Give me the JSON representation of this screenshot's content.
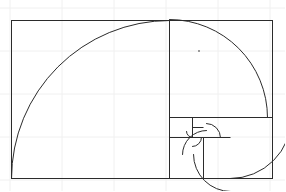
{
  "page": {
    "width": 285,
    "height": 191,
    "background_color": "#ffffff"
  },
  "style": {
    "stroke_color": "#2b2b2b",
    "grid_color": "#f0f0f0",
    "stroke_width": 1,
    "grid_width": 1,
    "speck_color": "#9a9a9a"
  },
  "figure": {
    "name": "golden-rectangle-fibonacci-spiral",
    "outer_rect": {
      "x": 11,
      "y": 20,
      "width": 261,
      "height": 158
    },
    "background_grid": {
      "visible": true,
      "vertical_x": [
        10,
        62,
        114,
        166,
        218,
        270
      ],
      "horizontal_y": [
        8,
        51,
        94,
        137,
        180
      ]
    },
    "squares": [
      {
        "label": "S1",
        "size": 158,
        "x": 11,
        "y": 20,
        "order": 1
      },
      {
        "label": "S2",
        "size": 98,
        "x": 169,
        "y": 20,
        "order": 2
      },
      {
        "label": "S3",
        "size": 61,
        "x": 169,
        "y": 117,
        "order": 3
      },
      {
        "label": "S4",
        "size": 37,
        "x": 230,
        "y": 117,
        "order": 4
      },
      {
        "label": "S5",
        "size": 24,
        "x": 206,
        "y": 154,
        "order": 5
      },
      {
        "label": "S6",
        "size": 14,
        "x": 192,
        "y": 140,
        "order": 6
      },
      {
        "label": "S7",
        "size": 9,
        "x": 192,
        "y": 131,
        "order": 7
      },
      {
        "label": "S8",
        "size": 6,
        "x": 201,
        "y": 131,
        "order": 8
      }
    ],
    "divider_lines": [
      {
        "name": "vertical-divider-main",
        "x1": 169,
        "y1": 20,
        "x2": 169,
        "y2": 178
      },
      {
        "name": "horizontal-divider-right",
        "x1": 169,
        "y1": 117,
        "x2": 272,
        "y2": 117
      },
      {
        "name": "vertical-divider-inner",
        "x1": 203,
        "y1": 137,
        "x2": 203,
        "y2": 178
      },
      {
        "name": "horizontal-divider-inner",
        "x1": 169,
        "y1": 137,
        "x2": 230,
        "y2": 137
      },
      {
        "name": "vertical-divider-tiny",
        "x1": 192,
        "y1": 117,
        "x2": 192,
        "y2": 137
      },
      {
        "name": "horizontal-divider-tiny",
        "x1": 192,
        "y1": 127,
        "x2": 203,
        "y2": 127
      }
    ],
    "spiral_arcs": [
      {
        "name": "arc-1",
        "cx": 169,
        "cy": 178,
        "r": 158,
        "from_deg": 180,
        "to_deg": 270
      },
      {
        "name": "arc-2",
        "cx": 169,
        "cy": 117,
        "r": 98,
        "from_deg": 270,
        "to_deg": 360
      },
      {
        "name": "arc-3",
        "cx": 230,
        "cy": 117,
        "r": 61,
        "from_deg": 0,
        "to_deg": 90
      },
      {
        "name": "arc-4",
        "cx": 230,
        "cy": 154,
        "r": 37,
        "from_deg": 90,
        "to_deg": 180
      },
      {
        "name": "arc-5",
        "cx": 206,
        "cy": 154,
        "r": 24,
        "from_deg": 180,
        "to_deg": 270
      },
      {
        "name": "arc-6",
        "cx": 206,
        "cy": 137,
        "r": 14,
        "from_deg": 270,
        "to_deg": 360
      },
      {
        "name": "arc-7",
        "cx": 192,
        "cy": 137,
        "r": 9,
        "from_deg": 0,
        "to_deg": 90
      },
      {
        "name": "arc-8",
        "cx": 192,
        "cy": 131,
        "r": 6,
        "from_deg": 90,
        "to_deg": 180
      }
    ],
    "speck": {
      "name": "stray-speck",
      "x": 198,
      "y": 50,
      "size": 2
    }
  }
}
